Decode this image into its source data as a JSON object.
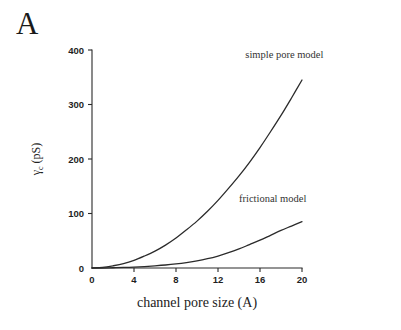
{
  "figure": {
    "panel_label": "A",
    "background_color": "#ffffff",
    "ink_color": "#2b2b2b"
  },
  "chart_data": {
    "type": "line",
    "title": "",
    "subtitle": "",
    "xlabel": "channel pore size (A)",
    "ylabel": "γc (pS)",
    "ylabel_main": "γ",
    "ylabel_subscript": "c",
    "ylabel_unit": " (pS)",
    "xlim": [
      0,
      20
    ],
    "ylim": [
      0,
      400
    ],
    "xticks": [
      0,
      4,
      8,
      12,
      16,
      20
    ],
    "xticklabels": [
      "0",
      "4",
      "8",
      "12",
      "16",
      "20"
    ],
    "yticks": [
      0,
      100,
      200,
      300,
      400
    ],
    "yticklabels": [
      "0",
      "100",
      "200",
      "300",
      "400"
    ],
    "grid": false,
    "legend_position": "inline-annotations",
    "series": [
      {
        "name": "simple pore model",
        "label_x": 14.6,
        "label_y": 385,
        "color": "#2b2b2b",
        "x": [
          0,
          1,
          2,
          3,
          4,
          5,
          6,
          7,
          8,
          9,
          10,
          11,
          12,
          13,
          14,
          15,
          16,
          17,
          18,
          19,
          20
        ],
        "y": [
          0,
          1,
          4,
          8,
          14,
          22,
          31,
          42,
          55,
          70,
          86,
          104,
          124,
          146,
          169,
          194,
          221,
          250,
          280,
          312,
          345
        ]
      },
      {
        "name": "frictional model",
        "label_x": 14.0,
        "label_y": 122,
        "color": "#2b2b2b",
        "x": [
          0,
          1,
          2,
          3,
          4,
          5,
          6,
          7,
          8,
          9,
          10,
          11,
          12,
          13,
          14,
          15,
          16,
          17,
          18,
          19,
          20
        ],
        "y": [
          0,
          0,
          0.5,
          1,
          1.7,
          2.7,
          4,
          5.5,
          7.5,
          10,
          13,
          17,
          22,
          28,
          35,
          43,
          51,
          60,
          69,
          77,
          85
        ]
      }
    ]
  }
}
